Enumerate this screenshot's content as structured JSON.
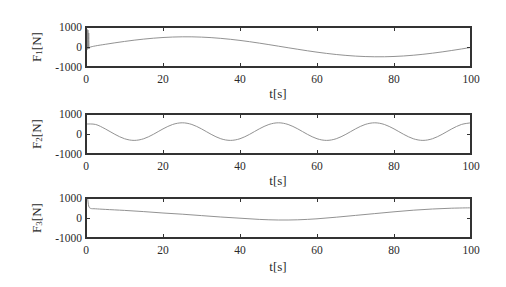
{
  "style": {
    "background": "#ffffff",
    "axes_color": "#333333",
    "line_color": "#8c8c8c",
    "text_color": "#2a2a2a"
  },
  "chart_data": [
    {
      "type": "line",
      "title": "",
      "xlabel": "t[s]",
      "ylabel": "F1[N]",
      "ylabel_parts": {
        "base": "F",
        "sub": "1",
        "unit": "[N]"
      },
      "xlim": [
        0,
        100
      ],
      "ylim": [
        -1000,
        1000
      ],
      "xticks": [
        0,
        20,
        40,
        60,
        80,
        100
      ],
      "xtick_labels": [
        "0",
        "20",
        "40",
        "60",
        "80",
        "100"
      ],
      "yticks": [
        -1000,
        0,
        1000
      ],
      "ytick_labels": [
        "-1000",
        "0",
        "1000"
      ],
      "grid": false,
      "legend": null,
      "series": [
        {
          "name": "F1",
          "x": [
            0,
            0.1,
            0.2,
            0.3,
            0.4,
            0.5,
            0.6,
            0.7,
            0.8,
            1.0,
            2.5,
            5,
            7.5,
            10,
            12.5,
            15,
            17.5,
            20,
            22.5,
            25,
            27.5,
            30,
            32.5,
            35,
            37.5,
            40,
            42.5,
            45,
            47.5,
            50,
            52.5,
            55,
            57.5,
            60,
            62.5,
            65,
            67.5,
            70,
            72.5,
            75,
            77.5,
            80,
            82.5,
            85,
            87.5,
            90,
            92.5,
            95,
            97.5,
            100
          ],
          "y": [
            0,
            900,
            -100,
            880,
            -120,
            850,
            -80,
            700,
            -40,
            -10,
            57,
            134,
            209,
            278,
            341,
            395,
            440,
            475,
            498,
            509,
            508,
            494,
            469,
            432,
            385,
            329,
            265,
            194,
            119,
            41,
            -37,
            -114,
            -189,
            -258,
            -321,
            -375,
            -420,
            -455,
            -478,
            -489,
            -488,
            -474,
            -449,
            -412,
            -365,
            -309,
            -245,
            -174,
            -99,
            -21
          ]
        }
      ]
    },
    {
      "type": "line",
      "title": "",
      "xlabel": "t[s]",
      "ylabel": "F2[N]",
      "ylabel_parts": {
        "base": "F",
        "sub": "2",
        "unit": "[N]"
      },
      "xlim": [
        0,
        100
      ],
      "ylim": [
        -1000,
        1000
      ],
      "xticks": [
        0,
        20,
        40,
        60,
        80,
        100
      ],
      "xtick_labels": [
        "0",
        "20",
        "40",
        "60",
        "80",
        "100"
      ],
      "yticks": [
        -1000,
        0,
        1000
      ],
      "ytick_labels": [
        "-1000",
        "0",
        "1000"
      ],
      "grid": false,
      "legend": null,
      "series": [
        {
          "name": "F2",
          "x": [
            0,
            2.5,
            5,
            7.5,
            10,
            12.5,
            15,
            17.5,
            20,
            22.5,
            25,
            27.5,
            30,
            32.5,
            35,
            37.5,
            40,
            42.5,
            45,
            47.5,
            50,
            52.5,
            55,
            57.5,
            60,
            62.5,
            65,
            67.5,
            70,
            72.5,
            75,
            77.5,
            80,
            82.5,
            85,
            87.5,
            90,
            92.5,
            95,
            97.5,
            100
          ],
          "y": [
            500,
            476,
            256,
            -16,
            -236,
            -320,
            -236,
            -16,
            256,
            476,
            560,
            476,
            256,
            -16,
            -236,
            -320,
            -236,
            -16,
            256,
            476,
            560,
            476,
            256,
            -16,
            -236,
            -320,
            -236,
            -16,
            256,
            476,
            560,
            476,
            256,
            -16,
            -236,
            -320,
            -236,
            -16,
            256,
            476,
            560
          ]
        }
      ]
    },
    {
      "type": "line",
      "title": "",
      "xlabel": "t[s]",
      "ylabel": "F3[N]",
      "ylabel_parts": {
        "base": "F",
        "sub": "3",
        "unit": "[N]"
      },
      "xlim": [
        0,
        100
      ],
      "ylim": [
        -1000,
        1000
      ],
      "xticks": [
        0,
        20,
        40,
        60,
        80,
        100
      ],
      "xtick_labels": [
        "0",
        "20",
        "40",
        "60",
        "80",
        "100"
      ],
      "yticks": [
        -1000,
        0,
        1000
      ],
      "ytick_labels": [
        "-1000",
        "0",
        "1000"
      ],
      "grid": false,
      "legend": null,
      "series": [
        {
          "name": "F3",
          "x": [
            0,
            0.4,
            0.7,
            1.2,
            2.5,
            5,
            10,
            15,
            20,
            25,
            30,
            35,
            40,
            45,
            50,
            55,
            60,
            65,
            70,
            75,
            80,
            85,
            90,
            95,
            100
          ],
          "y": [
            1000,
            980,
            600,
            480,
            460,
            430,
            380,
            320,
            250,
            190,
            120,
            50,
            -10,
            -70,
            -100,
            -90,
            -40,
            40,
            130,
            220,
            310,
            390,
            450,
            490,
            510
          ]
        }
      ]
    }
  ]
}
